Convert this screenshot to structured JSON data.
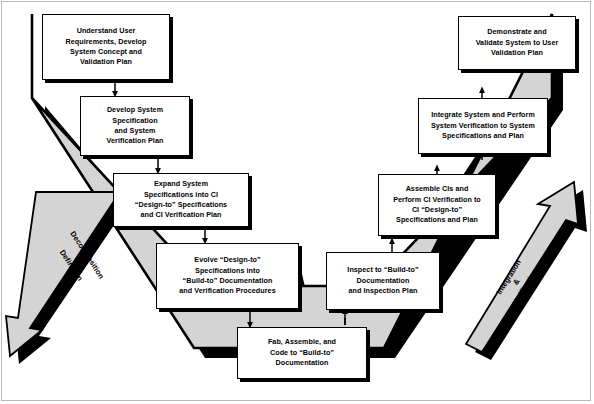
{
  "diagram": {
    "colors": {
      "v_fill": "#d4d4d4",
      "v_outline": "#000000",
      "shadow": "#000000",
      "box_fill": "#ffffff",
      "frame": "#b9b9b9"
    },
    "left_arrow": {
      "label": "Decomposition\n&\nDefinition",
      "direction": "down-left"
    },
    "right_arrow": {
      "label": "Integration\n&\nVerification",
      "direction": "up-right"
    },
    "boxes": [
      {
        "id": "understand-user-requirements",
        "text": "Understand User\nRequirements, Develop\nSystem Concept and\nValidation Plan",
        "side": "left",
        "level": 1
      },
      {
        "id": "develop-system-specification",
        "text": "Develop System\nSpecification\nand System\nVerification Plan",
        "side": "left",
        "level": 2
      },
      {
        "id": "expand-system-specifications",
        "text": "Expand System\nSpecifications into CI\n“Design-to” Specifications\nand CI Verification Plan",
        "side": "left",
        "level": 3
      },
      {
        "id": "evolve-design-to-specifications",
        "text": "Evolve “Design-to”\nSpecifications into\n“Build-to” Documentation\nand Verification Procedures",
        "side": "left",
        "level": 4
      },
      {
        "id": "fab-assemble-code",
        "text": "Fab, Assemble, and\nCode to “Build-to”\nDocumentation",
        "side": "bottom",
        "level": 5
      },
      {
        "id": "inspect-to-build-to",
        "text": "Inspect to “Build-to”\nDocumentation\nand Inspection Plan",
        "side": "right",
        "level": 4
      },
      {
        "id": "assemble-cis-perform-ci-verification",
        "text": "Assemble CIs and\nPerform CI Verification to\nCI “Design-to”\nSpecifications and Plan",
        "side": "right",
        "level": 3
      },
      {
        "id": "integrate-system-perform-verification",
        "text": "Integrate System and Perform\nSystem Verification to System\nSpecifications and Plan",
        "side": "right",
        "level": 2
      },
      {
        "id": "demonstrate-validate-system",
        "text": "Demonstrate and\nValidate System to User\nValidation Plan",
        "side": "right",
        "level": 1
      }
    ],
    "connectors": [
      {
        "from": "understand-user-requirements",
        "to": "develop-system-specification"
      },
      {
        "from": "develop-system-specification",
        "to": "expand-system-specifications"
      },
      {
        "from": "expand-system-specifications",
        "to": "evolve-design-to-specifications"
      },
      {
        "from": "evolve-design-to-specifications",
        "to": "fab-assemble-code"
      },
      {
        "from": "fab-assemble-code",
        "to": "inspect-to-build-to"
      },
      {
        "from": "inspect-to-build-to",
        "to": "assemble-cis-perform-ci-verification"
      },
      {
        "from": "assemble-cis-perform-ci-verification",
        "to": "integrate-system-perform-verification"
      },
      {
        "from": "integrate-system-perform-verification",
        "to": "demonstrate-validate-system"
      }
    ]
  }
}
